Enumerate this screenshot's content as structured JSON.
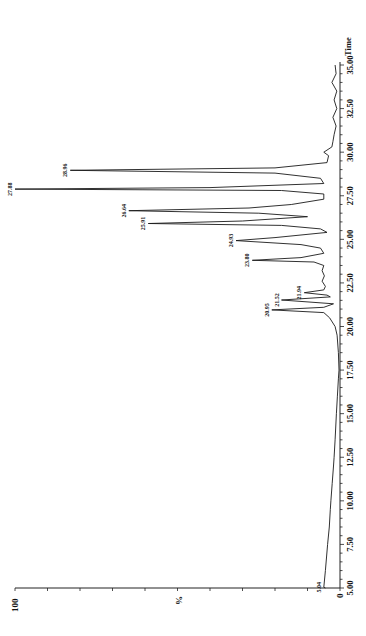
{
  "chart_data": {
    "type": "line",
    "title": "",
    "orientation": "rotated-90-ccw",
    "xlabel": "Time",
    "ylabel": "%",
    "xlim": [
      5.0,
      35.0
    ],
    "ylim": [
      0,
      100
    ],
    "x_ticks": [
      "5.00",
      "7.50",
      "10.00",
      "12.50",
      "15.00",
      "17.50",
      "20.00",
      "22.50",
      "25.00",
      "27.50",
      "30.00",
      "32.50",
      "35.00"
    ],
    "y_ticks": [
      "0",
      "100"
    ],
    "grid": false,
    "legend": null,
    "peaks": [
      {
        "label": "5.04",
        "time": 5.04,
        "intensity": 5
      },
      {
        "label": "20.95",
        "time": 20.95,
        "intensity": 21
      },
      {
        "label": "21.52",
        "time": 21.52,
        "intensity": 18
      },
      {
        "label": "21.94",
        "time": 21.94,
        "intensity": 11
      },
      {
        "label": "23.80",
        "time": 23.8,
        "intensity": 27
      },
      {
        "label": "24.93",
        "time": 24.93,
        "intensity": 32
      },
      {
        "label": "25.91",
        "time": 25.91,
        "intensity": 59
      },
      {
        "label": "26.64",
        "time": 26.64,
        "intensity": 65
      },
      {
        "label": "27.88",
        "time": 27.88,
        "intensity": 100
      },
      {
        "label": "28.96",
        "time": 28.96,
        "intensity": 83
      }
    ],
    "series": [
      {
        "name": "chromatogram",
        "x": [
          5.0,
          5.04,
          6.0,
          7.5,
          8.5,
          9.5,
          10.0,
          11.0,
          12.0,
          12.5,
          13.5,
          15.0,
          16.0,
          17.0,
          17.5,
          18.5,
          19.5,
          20.0,
          20.5,
          20.8,
          20.95,
          21.1,
          21.3,
          21.52,
          21.7,
          21.8,
          21.94,
          22.1,
          22.3,
          22.6,
          22.9,
          23.2,
          23.5,
          23.7,
          23.8,
          23.95,
          24.2,
          24.5,
          24.7,
          24.93,
          25.1,
          25.4,
          25.6,
          25.8,
          25.91,
          26.05,
          26.3,
          26.5,
          26.64,
          26.8,
          27.0,
          27.3,
          27.6,
          27.8,
          27.88,
          27.97,
          28.2,
          28.5,
          28.8,
          28.96,
          29.1,
          29.4,
          29.8,
          30.0,
          30.3,
          30.6,
          31.0,
          31.5,
          32.0,
          32.5,
          33.0,
          33.5,
          34.0,
          34.5,
          35.0
        ],
        "values": [
          4.5,
          5.0,
          4.5,
          3.8,
          3.3,
          3.0,
          2.8,
          2.4,
          2.0,
          1.8,
          1.5,
          1.1,
          0.8,
          0.5,
          0.3,
          0.5,
          0.9,
          1.5,
          3.2,
          5,
          21,
          5,
          2,
          18,
          3,
          4,
          11,
          5,
          4.5,
          5.5,
          4.8,
          5.5,
          5.0,
          8,
          27,
          12,
          5,
          6,
          12,
          32,
          20,
          4,
          6,
          18,
          59,
          30,
          10,
          25,
          65,
          28,
          15,
          5,
          5,
          18,
          100,
          40,
          5,
          6,
          20,
          83,
          20,
          4,
          3.5,
          5,
          2.5,
          2.2,
          1.8,
          1.2,
          2.2,
          1.0,
          1.8,
          1.0,
          2.5,
          1.2,
          1.5
        ]
      }
    ]
  },
  "axes": {
    "time_label": "Time",
    "percent_label": "%",
    "y_max_label": "100",
    "y_min_label": "0"
  }
}
